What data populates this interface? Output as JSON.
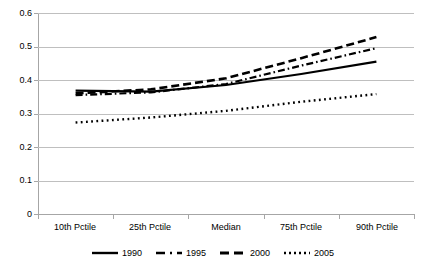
{
  "chart_data": {
    "type": "line",
    "title": "",
    "subtitle": "",
    "xlabel": "",
    "ylabel": "",
    "categories": [
      "10th Pctile",
      "25th Pctile",
      "Median",
      "75th Pctile",
      "90th Pctile"
    ],
    "ylim": [
      0,
      0.6
    ],
    "ytick_labels": [
      "0",
      "0.1",
      "0.2",
      "0.3",
      "0.4",
      "0.5",
      "0.6"
    ],
    "ytick_values": [
      0,
      0.1,
      0.2,
      0.3,
      0.4,
      0.5,
      0.6
    ],
    "grid": true,
    "legend_position": "bottom",
    "series": [
      {
        "name": "1990",
        "style": "solid",
        "color": "#000000",
        "values": [
          0.368,
          0.365,
          0.385,
          0.418,
          0.455
        ]
      },
      {
        "name": "1995",
        "style": "dash-dot",
        "color": "#000000",
        "values": [
          0.355,
          0.363,
          0.388,
          0.443,
          0.495
        ]
      },
      {
        "name": "2000",
        "style": "dashed",
        "color": "#000000",
        "values": [
          0.36,
          0.372,
          0.405,
          0.465,
          0.528
        ]
      },
      {
        "name": "2005",
        "style": "dotted",
        "color": "#000000",
        "values": [
          0.273,
          0.288,
          0.308,
          0.335,
          0.358
        ]
      }
    ]
  },
  "legend": {
    "entries": [
      {
        "label": "1990",
        "style": "solid"
      },
      {
        "label": "1995",
        "style": "dash-dot"
      },
      {
        "label": "2000",
        "style": "dashed"
      },
      {
        "label": "2005",
        "style": "dotted"
      }
    ]
  },
  "colors": {
    "series": "#000000",
    "gridline": "#bfbfbf",
    "axis": "#a6a6a6",
    "background": "#ffffff"
  }
}
